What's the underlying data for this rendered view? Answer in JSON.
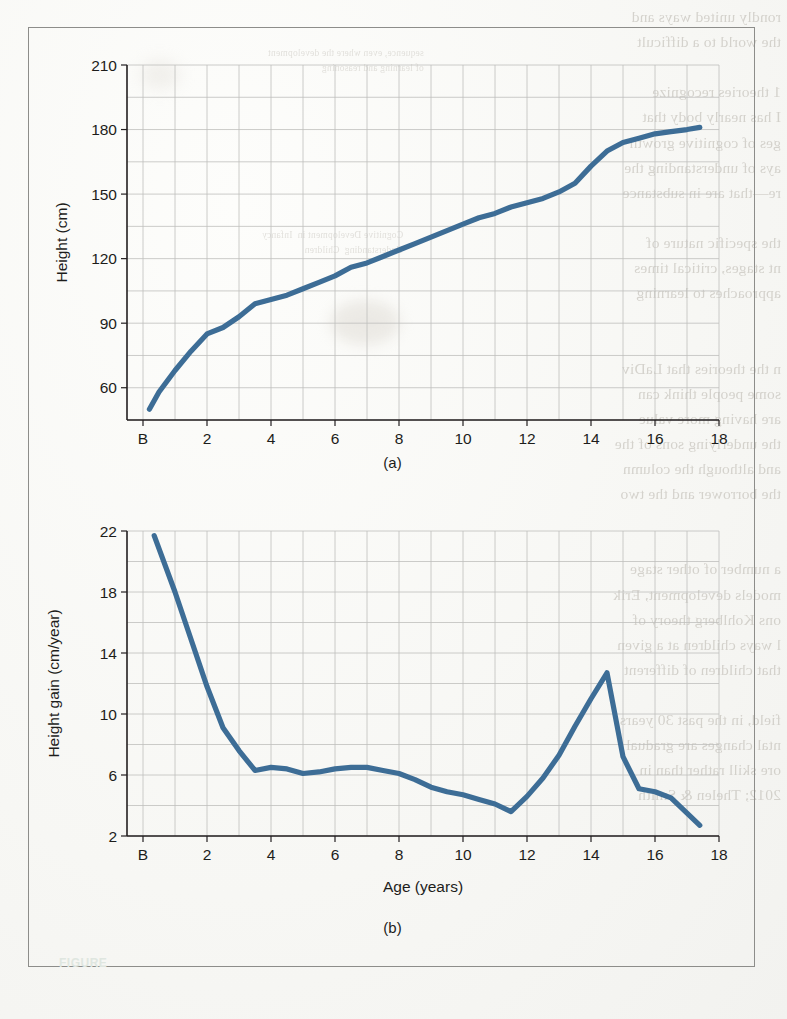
{
  "figure": {
    "frame_border_color": "#8d8d8a",
    "line_color": "#3d6d96",
    "grid_color": "#bfbfbd",
    "axis_color": "#231f20",
    "bottom_label": "FIGURE"
  },
  "panels": [
    {
      "id": "a",
      "caption": "(a)"
    },
    {
      "id": "b",
      "caption": "(b)"
    }
  ],
  "bleed_text": {
    "right_column": "rondly united ways and\nthe world to a difficult\n\n1 theories recognize\nI has nearly body that\nges of cognitive growth\nays of understanding the\nre—that are in substance\n\nthe specific nature of\nnt stages, critical times\napproaches to learning\n\n\nn the theories that LaDiv\nsome people think can\nare having more value\nthe underlying sons of the\nand although the column\nthe borrower and the two\n\n\na number of other stage\nmodels development, Erik\nons Kohlberg theory of\nl ways children at a given\nthat children of different\n\nfield, in the past 30 years\nntal changes are gradual\nore skill rather than in\n2012; Thelen & Smith",
    "mid_column_top": "sequence, even where the development\nof learning and reasoning",
    "mid_column_body": "Cognitive Development in  Infancy\nUnderstanding  Children",
    "left_column_top": ""
  },
  "chart_data": [
    {
      "type": "line",
      "panel": "a",
      "title": "",
      "xlabel": "Age (years)",
      "ylabel": "Height (cm)",
      "xlim": [
        -0.5,
        18
      ],
      "ylim": [
        45,
        210
      ],
      "yticks": [
        60,
        90,
        120,
        150,
        180,
        210
      ],
      "xticks": [
        0,
        2,
        4,
        6,
        8,
        10,
        12,
        14,
        16,
        18
      ],
      "xticklabels": [
        "B",
        "2",
        "4",
        "6",
        "8",
        "10",
        "12",
        "14",
        "16",
        "18"
      ],
      "grid": true,
      "minor_grid_x": 1,
      "minor_grid_y": 15,
      "legend": "none",
      "x": [
        0.2,
        0.5,
        1,
        1.5,
        2,
        2.5,
        3,
        3.5,
        4,
        4.5,
        5,
        5.5,
        6,
        6.5,
        7,
        7.5,
        8,
        8.5,
        9,
        9.5,
        10,
        10.5,
        11,
        11.5,
        12,
        12.5,
        13,
        13.5,
        14,
        14.5,
        15,
        15.5,
        16,
        16.5,
        17,
        17.4
      ],
      "values": [
        50,
        58,
        68,
        77,
        85,
        88,
        93,
        99,
        101,
        103,
        106,
        109,
        112,
        116,
        118,
        121,
        124,
        127,
        130,
        133,
        136,
        139,
        141,
        144,
        146,
        148,
        151,
        155,
        163,
        170,
        174,
        176,
        178,
        179,
        180,
        181
      ]
    },
    {
      "type": "line",
      "panel": "b",
      "title": "",
      "xlabel": "Age (years)",
      "ylabel": "Height gain (cm/year)",
      "xlim": [
        -0.5,
        18
      ],
      "ylim": [
        2,
        22
      ],
      "yticks": [
        2,
        6,
        10,
        14,
        18,
        22
      ],
      "xticks": [
        0,
        2,
        4,
        6,
        8,
        10,
        12,
        14,
        16,
        18
      ],
      "xticklabels": [
        "B",
        "2",
        "4",
        "6",
        "8",
        "10",
        "12",
        "14",
        "16",
        "18"
      ],
      "grid": true,
      "minor_grid_x": 1,
      "minor_grid_y": 2,
      "legend": "none",
      "x": [
        0.35,
        1.0,
        1.5,
        2.0,
        2.5,
        3.0,
        3.5,
        4.0,
        4.5,
        5.0,
        5.5,
        6.0,
        6.5,
        7.0,
        7.5,
        8.0,
        8.5,
        9.0,
        9.5,
        10.0,
        10.5,
        11.0,
        11.5,
        12.0,
        12.5,
        13.0,
        13.5,
        14.0,
        14.5,
        15.0,
        15.5,
        16.0,
        16.5,
        17.0,
        17.4
      ],
      "values": [
        21.7,
        18.0,
        14.9,
        11.8,
        9.1,
        7.6,
        6.3,
        6.5,
        6.4,
        6.1,
        6.2,
        6.4,
        6.5,
        6.5,
        6.3,
        6.1,
        5.7,
        5.2,
        4.9,
        4.7,
        4.4,
        4.1,
        3.6,
        4.6,
        5.8,
        7.3,
        9.2,
        11.0,
        12.7,
        7.2,
        5.1,
        4.9,
        4.5,
        3.5,
        2.7
      ]
    }
  ]
}
